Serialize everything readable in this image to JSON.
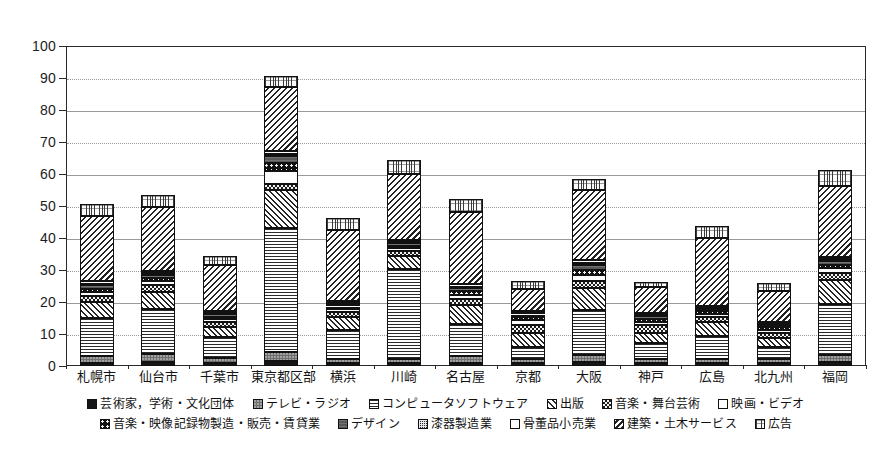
{
  "chart_data": {
    "type": "bar",
    "subtype": "stacked-bar",
    "title": "",
    "xlabel": "",
    "ylabel": "",
    "ylim": [
      0,
      100
    ],
    "ytick_values": [
      0,
      10,
      20,
      30,
      40,
      50,
      60,
      70,
      80,
      90,
      100
    ],
    "ytick_labels": [
      "0",
      "10",
      "20",
      "30",
      "40",
      "50",
      "60",
      "70",
      "80",
      "90",
      "100"
    ],
    "grid": true,
    "legend_position": "bottom",
    "categories": [
      "札幌市",
      "仙台市",
      "千葉市",
      "東京都区部",
      "横浜",
      "川崎",
      "名古屋",
      "京都",
      "大阪",
      "神戸",
      "広島",
      "北九州",
      "福岡"
    ],
    "series": [
      {
        "name": "芸術家，学術・文化団体",
        "pattern": "p-solid-black",
        "values": [
          1.0,
          1.2,
          0.8,
          1.5,
          0.8,
          0.8,
          1.0,
          0.8,
          1.2,
          0.8,
          0.8,
          0.8,
          1.2
        ]
      },
      {
        "name": "テレビ・ラジオ",
        "pattern": "p-dark-speck",
        "values": [
          2.0,
          2.5,
          1.8,
          3.0,
          1.5,
          1.5,
          2.0,
          1.5,
          2.3,
          1.5,
          1.5,
          1.5,
          2.3
        ]
      },
      {
        "name": "コンピュータソフトウェア",
        "pattern": "p-hlines",
        "values": [
          12.0,
          14.0,
          6.5,
          38.5,
          9.0,
          28.0,
          10.0,
          3.5,
          14.0,
          5.0,
          7.0,
          3.5,
          16.0
        ]
      },
      {
        "name": "出版",
        "pattern": "p-diag-back",
        "values": [
          5.0,
          5.5,
          3.0,
          12.0,
          4.0,
          4.0,
          6.0,
          4.5,
          7.0,
          3.0,
          4.5,
          3.0,
          7.5
        ]
      },
      {
        "name": "音楽・舞台芸術",
        "pattern": "p-checker",
        "values": [
          2.0,
          2.0,
          1.5,
          2.0,
          1.5,
          1.5,
          2.0,
          2.5,
          2.0,
          2.5,
          1.5,
          1.5,
          2.0
        ]
      },
      {
        "name": "映画・ビデオ",
        "pattern": "p-white",
        "values": [
          1.2,
          1.3,
          1.0,
          4.0,
          1.0,
          1.0,
          1.3,
          1.5,
          2.0,
          1.0,
          1.0,
          1.0,
          1.5
        ]
      },
      {
        "name": "音楽・映像記録物製造・販売・賃貸業",
        "pattern": "p-coarse-dot",
        "values": [
          1.0,
          1.0,
          0.8,
          2.5,
          0.8,
          0.8,
          1.0,
          1.0,
          1.5,
          1.0,
          0.8,
          0.8,
          1.2
        ]
      },
      {
        "name": "デザイン",
        "pattern": "p-mid-grey",
        "values": [
          1.0,
          1.0,
          0.8,
          2.0,
          0.8,
          0.8,
          1.0,
          0.8,
          1.5,
          0.8,
          0.8,
          0.8,
          1.2
        ]
      },
      {
        "name": "漆器製造業",
        "pattern": "p-fine-grid",
        "values": [
          0.5,
          0.5,
          0.4,
          0.6,
          0.4,
          0.4,
          0.5,
          0.4,
          0.6,
          0.4,
          0.4,
          0.4,
          0.5
        ]
      },
      {
        "name": "骨董品小売業",
        "pattern": "p-open-white",
        "values": [
          0.8,
          0.8,
          0.6,
          1.0,
          0.6,
          0.6,
          0.8,
          0.6,
          1.0,
          0.6,
          0.6,
          0.6,
          0.8
        ]
      },
      {
        "name": "建築・土木サービス",
        "pattern": "p-diag-fwd",
        "values": [
          20.5,
          20.0,
          14.5,
          20.0,
          22.0,
          20.5,
          22.5,
          7.0,
          22.0,
          8.0,
          21.0,
          9.5,
          22.0
        ]
      },
      {
        "name": "広告",
        "pattern": "p-vfine-vert",
        "values": [
          3.5,
          3.7,
          2.8,
          3.4,
          4.0,
          4.5,
          4.2,
          2.5,
          3.5,
          1.8,
          4.0,
          2.5,
          5.0
        ]
      }
    ],
    "totals": [
      50.5,
      53.5,
      34.5,
      90.5,
      46.4,
      64.4,
      52.3,
      26.6,
      58.6,
      26.4,
      43.9,
      25.9,
      61.2
    ]
  },
  "axis": {
    "y_ticks": [
      "100",
      "90",
      "80",
      "70",
      "60",
      "50",
      "40",
      "30",
      "20",
      "10",
      "0"
    ]
  },
  "legend": {
    "row1": [
      {
        "label": "芸術家，学術・文化団体",
        "pattern": "p-solid-black",
        "name": "legend-artists"
      },
      {
        "label": "テレビ・ラジオ",
        "pattern": "p-dark-speck",
        "name": "legend-tv-radio"
      },
      {
        "label": "コンピュータソフトウェア",
        "pattern": "p-hlines",
        "name": "legend-computer-software"
      },
      {
        "label": "出版",
        "pattern": "p-diag-back",
        "name": "legend-publishing"
      },
      {
        "label": "音楽・舞台芸術",
        "pattern": "p-checker",
        "name": "legend-music-stage-arts"
      },
      {
        "label": "映画・ビデオ",
        "pattern": "p-white",
        "name": "legend-film-video"
      }
    ],
    "row2": [
      {
        "label": "音楽・映像記録物製造・販売・賃貸業",
        "pattern": "p-coarse-dot",
        "name": "legend-music-video-media"
      },
      {
        "label": "デザイン",
        "pattern": "p-mid-grey",
        "name": "legend-design"
      },
      {
        "label": "漆器製造業",
        "pattern": "p-fine-grid",
        "name": "legend-lacquerware"
      },
      {
        "label": "骨董品小売業",
        "pattern": "p-open-white",
        "name": "legend-antiques-retail"
      },
      {
        "label": "建築・土木サービス",
        "pattern": "p-diag-fwd",
        "name": "legend-architecture-civil"
      },
      {
        "label": "広告",
        "pattern": "p-vfine-vert",
        "name": "legend-advertising"
      }
    ]
  },
  "colors": {
    "frame": "#2b2b2b",
    "grid": "#9a9a9a",
    "text": "#141414",
    "background": "#ffffff"
  }
}
